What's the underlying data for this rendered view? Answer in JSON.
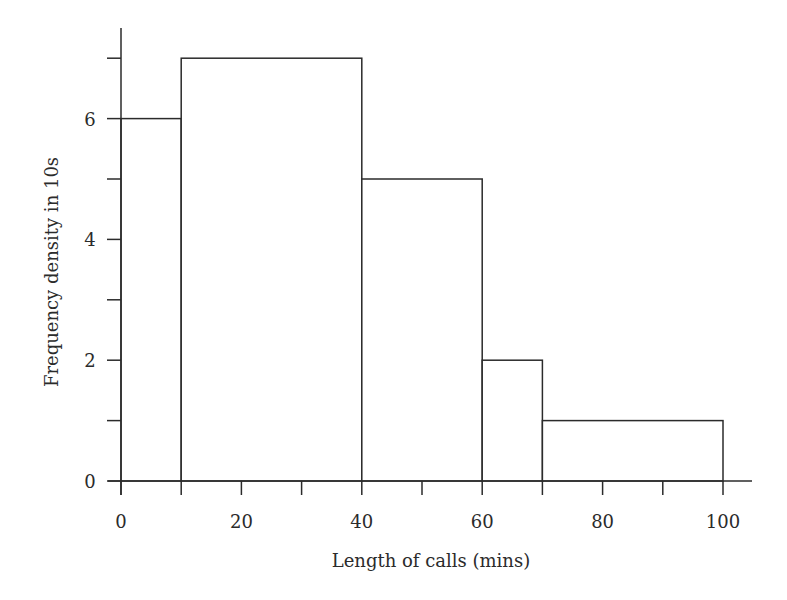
{
  "chart_data": {
    "type": "bar",
    "subtype": "histogram",
    "title": "",
    "xlabel": "Length of calls (mins)",
    "ylabel": "Frequency density in 10s",
    "xlim": [
      0,
      100
    ],
    "ylim": [
      0,
      7
    ],
    "grid": false,
    "legend": null,
    "x_ticks": [
      0,
      10,
      20,
      30,
      40,
      50,
      60,
      70,
      80,
      90,
      100
    ],
    "x_tick_labels": [
      "0",
      "20",
      "40",
      "60",
      "80",
      "100"
    ],
    "x_tick_label_values": [
      0,
      20,
      40,
      60,
      80,
      100
    ],
    "y_ticks": [
      0,
      1,
      2,
      3,
      4,
      5,
      6,
      7
    ],
    "y_tick_labels": [
      "0",
      "2",
      "4",
      "6"
    ],
    "y_tick_label_values": [
      0,
      2,
      4,
      6
    ],
    "bins": [
      {
        "from": 0,
        "to": 10,
        "frequency_density": 6
      },
      {
        "from": 10,
        "to": 40,
        "frequency_density": 7
      },
      {
        "from": 40,
        "to": 60,
        "frequency_density": 5
      },
      {
        "from": 60,
        "to": 70,
        "frequency_density": 2
      },
      {
        "from": 70,
        "to": 100,
        "frequency_density": 1
      }
    ],
    "categories": [
      "0-10",
      "10-40",
      "40-60",
      "60-70",
      "70-100"
    ],
    "values": [
      6,
      7,
      5,
      2,
      1
    ]
  },
  "style": {
    "line_color": "#2b2b2b",
    "bar_fill": "#ffffff",
    "background": "#ffffff"
  }
}
